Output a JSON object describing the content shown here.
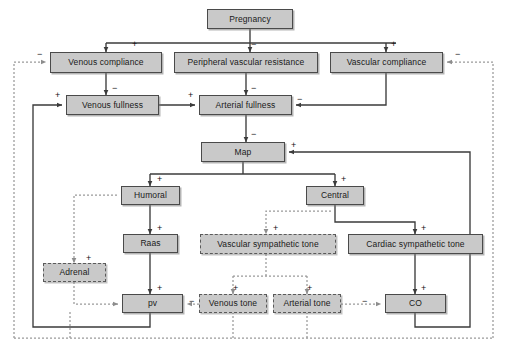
{
  "diagram": {
    "colors": {
      "node_fill": "#c9c9c9",
      "node_border_solid": "#4a4a4a",
      "node_border_dashed": "#5a5a5a",
      "edge_solid": "#3b3b3b",
      "edge_dotted": "#9a9a9a",
      "background": "#ffffff",
      "text": "#1a1a1a"
    },
    "nodes": [
      {
        "id": "pregnancy",
        "label": "Pregnancy",
        "style": "solid",
        "x": 207,
        "y": 9,
        "w": 86,
        "h": 20
      },
      {
        "id": "venous_compliance",
        "label": "Venous compliance",
        "style": "solid",
        "x": 50,
        "y": 52,
        "w": 112,
        "h": 21
      },
      {
        "id": "pvr",
        "label": "Peripheral vascular resistance",
        "style": "solid",
        "x": 174,
        "y": 52,
        "w": 144,
        "h": 21
      },
      {
        "id": "vascular_compliance",
        "label": "Vascular compliance",
        "style": "solid",
        "x": 330,
        "y": 52,
        "w": 113,
        "h": 21
      },
      {
        "id": "venous_fullness",
        "label": "Venous fullness",
        "style": "solid",
        "x": 66,
        "y": 95,
        "w": 93,
        "h": 20
      },
      {
        "id": "arterial_fullness",
        "label": "Arterial fullness",
        "style": "solid",
        "x": 199,
        "y": 95,
        "w": 93,
        "h": 20
      },
      {
        "id": "map",
        "label": "Map",
        "style": "solid",
        "x": 201,
        "y": 142,
        "w": 84,
        "h": 20
      },
      {
        "id": "humoral",
        "label": "Humoral",
        "style": "solid",
        "x": 121,
        "y": 186,
        "w": 59,
        "h": 19
      },
      {
        "id": "central",
        "label": "Central",
        "style": "solid",
        "x": 306,
        "y": 186,
        "w": 58,
        "h": 19
      },
      {
        "id": "raas",
        "label": "Raas",
        "style": "solid",
        "x": 123,
        "y": 234,
        "w": 55,
        "h": 19
      },
      {
        "id": "vascular_symp",
        "label": "Vascular sympathetic tone",
        "style": "dashed",
        "x": 200,
        "y": 234,
        "w": 136,
        "h": 20
      },
      {
        "id": "cardiac_symp",
        "label": "Cardiac sympathetic tone",
        "style": "solid",
        "x": 348,
        "y": 234,
        "w": 135,
        "h": 20
      },
      {
        "id": "adrenal",
        "label": "Adrenal",
        "style": "dashed",
        "x": 43,
        "y": 263,
        "w": 63,
        "h": 19
      },
      {
        "id": "pv",
        "label": "pv",
        "style": "solid",
        "x": 122,
        "y": 294,
        "w": 61,
        "h": 19
      },
      {
        "id": "venous_tone",
        "label": "Venous tone",
        "style": "dashed",
        "x": 199,
        "y": 294,
        "w": 68,
        "h": 19
      },
      {
        "id": "arterial_tone",
        "label": "Arterial tone",
        "style": "dashed",
        "x": 273,
        "y": 294,
        "w": 68,
        "h": 19
      },
      {
        "id": "co",
        "label": "CO",
        "style": "solid",
        "x": 385,
        "y": 294,
        "w": 61,
        "h": 19
      }
    ],
    "edge_signs": [
      {
        "id": "s1",
        "sign": "+",
        "x": 132,
        "y": 40
      },
      {
        "id": "s2",
        "sign": "−",
        "x": 251,
        "y": 40
      },
      {
        "id": "s3",
        "sign": "+",
        "x": 391,
        "y": 40
      },
      {
        "id": "s4",
        "sign": "−",
        "x": 37,
        "y": 50
      },
      {
        "id": "s5",
        "sign": "−",
        "x": 455,
        "y": 50
      },
      {
        "id": "s6",
        "sign": "−",
        "x": 112,
        "y": 84
      },
      {
        "id": "s7",
        "sign": "−",
        "x": 251,
        "y": 84
      },
      {
        "id": "s8",
        "sign": "+",
        "x": 55,
        "y": 91
      },
      {
        "id": "s9",
        "sign": "+",
        "x": 188,
        "y": 91
      },
      {
        "id": "s10",
        "sign": "−",
        "x": 297,
        "y": 95
      },
      {
        "id": "s11",
        "sign": "−",
        "x": 251,
        "y": 130
      },
      {
        "id": "s12",
        "sign": "+",
        "x": 291,
        "y": 141
      },
      {
        "id": "s13",
        "sign": "+",
        "x": 157,
        "y": 175
      },
      {
        "id": "s14",
        "sign": "+",
        "x": 341,
        "y": 175
      },
      {
        "id": "s15",
        "sign": "+",
        "x": 157,
        "y": 224
      },
      {
        "id": "s16",
        "sign": "+",
        "x": 273,
        "y": 224
      },
      {
        "id": "s17",
        "sign": "+",
        "x": 421,
        "y": 224
      },
      {
        "id": "s18",
        "sign": "+",
        "x": 86,
        "y": 254
      },
      {
        "id": "s19",
        "sign": "+",
        "x": 157,
        "y": 284
      },
      {
        "id": "s20",
        "sign": "+",
        "x": 233,
        "y": 284
      },
      {
        "id": "s21",
        "sign": "+",
        "x": 307,
        "y": 284
      },
      {
        "id": "s22",
        "sign": "+",
        "x": 421,
        "y": 284
      },
      {
        "id": "s23",
        "sign": "−",
        "x": 189,
        "y": 297
      },
      {
        "id": "s24",
        "sign": "−",
        "x": 362,
        "y": 297
      }
    ]
  }
}
